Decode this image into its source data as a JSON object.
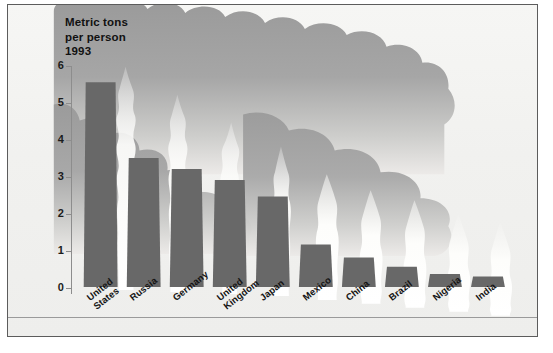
{
  "figure": {
    "title": "Metric tons\nper person\n1993",
    "title_lines": [
      "Metric tons",
      "per person",
      "1993"
    ],
    "background_color": "#f1f1ef",
    "bar_color": "#686868",
    "smoke_color": "#9b9b9b",
    "plume_color": "#f7f7f5",
    "axis_color": "#8d8d8d",
    "frame_color": "#5c5c5c"
  },
  "chart_data": {
    "type": "bar",
    "title": "Metric tons per person 1993",
    "xlabel": "",
    "ylabel": "Metric tons per person 1993",
    "ylim": [
      0,
      6
    ],
    "yticks": [
      0,
      1,
      2,
      3,
      4,
      5,
      6
    ],
    "ytick_labels": [
      "0",
      "1",
      "2",
      "3",
      "4",
      "5",
      "6"
    ],
    "grid": false,
    "legend": false,
    "categories": [
      "United States",
      "Russia",
      "Germany",
      "United Kingdom",
      "Japan",
      "Mexico",
      "China",
      "Brazil",
      "Nigeria",
      "India"
    ],
    "category_labels": [
      "United\nStates",
      "Russia",
      "Germany",
      "United\nKingdom",
      "Japan",
      "Mexico",
      "China",
      "Brazil",
      "Nigeria",
      "India"
    ],
    "values": [
      5.55,
      3.5,
      3.2,
      2.9,
      2.45,
      1.15,
      0.8,
      0.55,
      0.35,
      0.28
    ],
    "units": "metric tons per person"
  }
}
